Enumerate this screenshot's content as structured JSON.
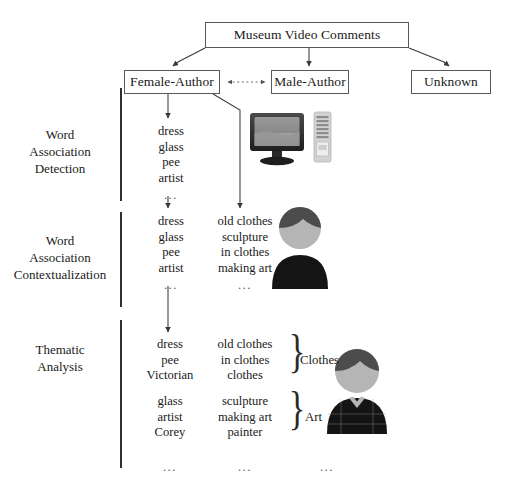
{
  "diagram": {
    "root_node": {
      "label": "Museum Video Comments"
    },
    "author_nodes": [
      {
        "id": "female-author",
        "label": "Female-Author"
      },
      {
        "id": "male-author",
        "label": "Male-Author"
      },
      {
        "id": "unknown",
        "label": "Unknown"
      }
    ],
    "stages": [
      {
        "id": "stage-1",
        "label_lines": [
          "Word",
          "Association",
          "Detection"
        ],
        "label": "Word Association Detection"
      },
      {
        "id": "stage-2",
        "label_lines": [
          "Word",
          "Association",
          "Contextualization"
        ],
        "label": "Word Association Contextualization"
      },
      {
        "id": "stage-3",
        "label_lines": [
          "Thematic",
          "Analysis"
        ],
        "label": "Thematic Analysis"
      }
    ],
    "stage1": {
      "column1": [
        "dress",
        "glass",
        "pee",
        "artist"
      ],
      "ellipsis": "..."
    },
    "stage2": {
      "column1": [
        "dress",
        "glass",
        "pee",
        "artist"
      ],
      "column2": [
        "old clothes",
        "sculpture",
        "in clothes",
        "making art"
      ],
      "ellipsis1": "...",
      "ellipsis2": "..."
    },
    "stage3": {
      "groups": [
        {
          "theme": "Clothes",
          "column1": [
            "dress",
            "pee",
            "Victorian"
          ],
          "column2": [
            "old clothes",
            "in clothes",
            "clothes"
          ],
          "brace": "}"
        },
        {
          "theme": "Art",
          "column1": [
            "glass",
            "artist",
            "Corey"
          ],
          "column2": [
            "sculpture",
            "making art",
            "painter"
          ],
          "brace": "}"
        }
      ],
      "bottom_ellipses": [
        "...",
        "...",
        "..."
      ]
    },
    "icons": [
      {
        "name": "monitor-icon",
        "description": "computer monitor"
      },
      {
        "name": "server-tower-icon",
        "description": "server tower"
      },
      {
        "name": "person-avatar-icon",
        "description": "person avatar dark hair"
      },
      {
        "name": "person-avatar-collared-icon",
        "description": "person avatar with collared plaid shirt"
      }
    ],
    "colors": {
      "box_border": "#555a5e",
      "text": "#1a1a1a",
      "connector": "#3a3a3a",
      "divider": "#2f2f2f",
      "monitor_bezel": "#2b2b2b",
      "monitor_screen": "#8e8e8e",
      "server_body": "#c9c9c9",
      "avatar_hair": "#4a4a4a",
      "avatar_face": "#b3b3b3",
      "avatar_body": "#141414"
    }
  }
}
